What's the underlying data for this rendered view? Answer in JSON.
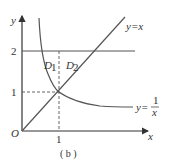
{
  "diagram": {
    "caption": "( b )",
    "axes": {
      "x_label": "x",
      "y_label": "y",
      "origin_label": "O",
      "x_ticks": [
        "1"
      ],
      "y_ticks": [
        "1",
        "2"
      ]
    },
    "curves": [
      {
        "name": "line-y-eq-x",
        "label": "y=x"
      },
      {
        "name": "hyperbola",
        "label_lhs": "y=",
        "label_num": "1",
        "label_den": "x"
      },
      {
        "name": "line-y-eq-2",
        "label": ""
      }
    ],
    "regions": [
      {
        "name": "D1",
        "label": "D",
        "sub": "1"
      },
      {
        "name": "D2",
        "label": "D",
        "sub": "2"
      }
    ],
    "colors": {
      "curve": "#555555",
      "axis": "#333333",
      "text": "#333333"
    }
  }
}
